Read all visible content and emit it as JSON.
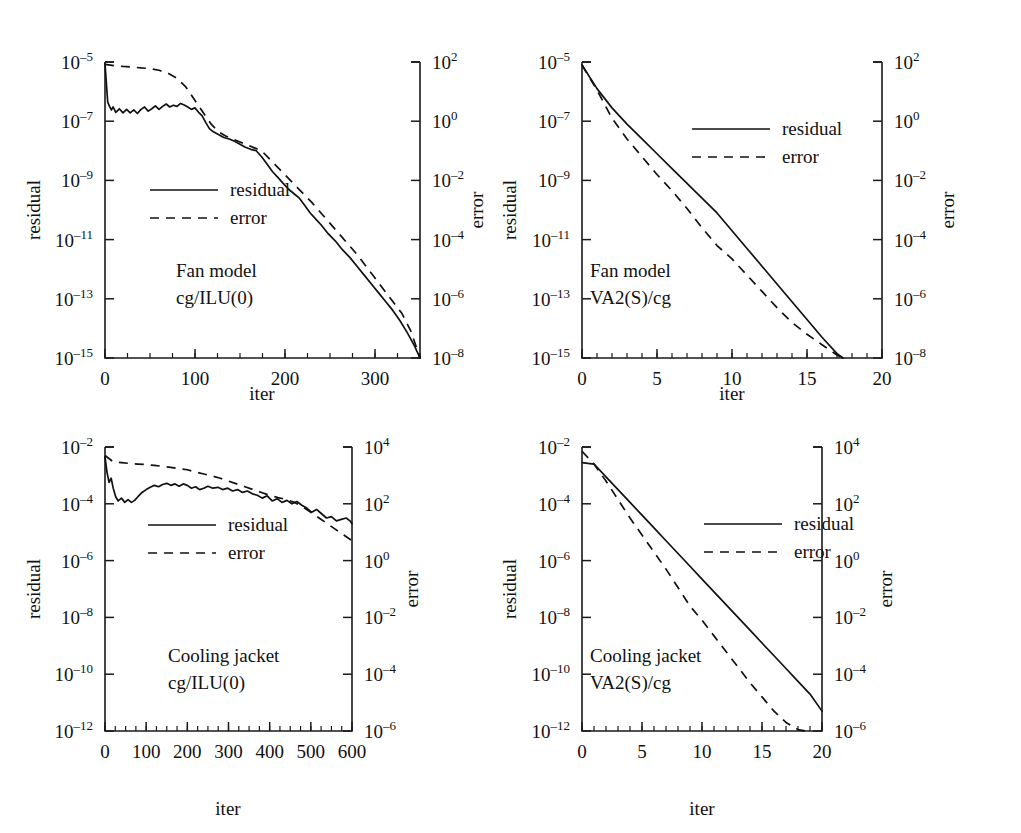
{
  "figure": {
    "kind": "four-panel-convergence-figure",
    "legend_labels": {
      "residual": "residual",
      "error": "error"
    },
    "axis_names": {
      "x": "iter",
      "left_y": "residual",
      "right_y": "error"
    }
  },
  "chart_data": [
    {
      "id": "top-left",
      "type": "line",
      "title": "",
      "annotation_line1": "Fan model",
      "annotation_line2": "cg/ILU(0)",
      "xlabel": "iter",
      "ylabel": "residual",
      "y2label": "error",
      "xlim": [
        0,
        350
      ],
      "xticks": [
        0,
        100,
        200,
        300
      ],
      "xticklabels": [
        "0",
        "100",
        "200",
        "300"
      ],
      "xminor_step": 25,
      "ylim_exp": [
        -15,
        -5
      ],
      "yticks_exp": [
        -15,
        -13,
        -11,
        -9,
        -7,
        -5
      ],
      "yticklabels": [
        "10^-15",
        "10^-13",
        "10^-11",
        "10^-9",
        "10^-7",
        "10^-5"
      ],
      "y2lim_exp": [
        -8,
        2
      ],
      "y2ticks_exp": [
        -8,
        -6,
        -4,
        -2,
        0,
        2
      ],
      "y2ticklabels": [
        "10^-8",
        "10^-6",
        "10^-4",
        "10^-2",
        "10^0",
        "10^2"
      ],
      "grid": false,
      "legend_position": "center-left",
      "series": [
        {
          "name": "residual",
          "style": "solid",
          "x": [
            0,
            3,
            5,
            7,
            9,
            12,
            16,
            20,
            24,
            28,
            32,
            36,
            40,
            44,
            48,
            52,
            56,
            60,
            64,
            68,
            72,
            76,
            80,
            84,
            88,
            92,
            96,
            100,
            104,
            108,
            112,
            116,
            120,
            126,
            132,
            138,
            144,
            150,
            156,
            162,
            168,
            174,
            180,
            186,
            192,
            198,
            204,
            210,
            216,
            222,
            228,
            234,
            240,
            248,
            256,
            264,
            272,
            280,
            288,
            296,
            304,
            312,
            320,
            328,
            336,
            344,
            350
          ],
          "y_exp": [
            -5.05,
            -6.35,
            -6.5,
            -6.62,
            -6.52,
            -6.7,
            -6.58,
            -6.72,
            -6.6,
            -6.72,
            -6.62,
            -6.74,
            -6.6,
            -6.52,
            -6.66,
            -6.58,
            -6.48,
            -6.6,
            -6.5,
            -6.42,
            -6.52,
            -6.46,
            -6.5,
            -6.4,
            -6.45,
            -6.52,
            -6.6,
            -6.55,
            -6.7,
            -6.82,
            -7.05,
            -7.25,
            -7.35,
            -7.45,
            -7.55,
            -7.6,
            -7.68,
            -7.78,
            -7.88,
            -7.95,
            -8.0,
            -8.2,
            -8.45,
            -8.7,
            -8.9,
            -9.1,
            -9.3,
            -9.45,
            -9.6,
            -9.85,
            -10.1,
            -10.3,
            -10.5,
            -10.8,
            -11.05,
            -11.35,
            -11.6,
            -11.9,
            -12.2,
            -12.5,
            -12.8,
            -13.1,
            -13.4,
            -13.75,
            -14.15,
            -14.6,
            -15.0
          ]
        },
        {
          "name": "error",
          "style": "dashed",
          "x": [
            0,
            10,
            20,
            30,
            40,
            50,
            60,
            70,
            80,
            90,
            100,
            110,
            118,
            126,
            134,
            142,
            150,
            158,
            166,
            174,
            182,
            190,
            198,
            206,
            214,
            222,
            230,
            240,
            250,
            260,
            270,
            280,
            290,
            300,
            310,
            320,
            330,
            340,
            350
          ],
          "y_exp": [
            -5.08,
            -5.12,
            -5.15,
            -5.17,
            -5.2,
            -5.22,
            -5.28,
            -5.38,
            -5.55,
            -5.85,
            -6.3,
            -6.75,
            -7.1,
            -7.35,
            -7.5,
            -7.6,
            -7.7,
            -7.8,
            -7.9,
            -8.0,
            -8.25,
            -8.5,
            -8.75,
            -9.0,
            -9.25,
            -9.5,
            -9.75,
            -10.1,
            -10.45,
            -10.8,
            -11.15,
            -11.5,
            -11.9,
            -12.3,
            -12.7,
            -13.1,
            -13.5,
            -14.1,
            -15.0
          ]
        }
      ]
    },
    {
      "id": "top-right",
      "type": "line",
      "title": "",
      "annotation_line1": "Fan model",
      "annotation_line2": "VA2(S)/cg",
      "xlabel": "iter",
      "ylabel": "residual",
      "y2label": "error",
      "xlim": [
        0,
        20
      ],
      "xticks": [
        0,
        5,
        10,
        15,
        20
      ],
      "xticklabels": [
        "0",
        "5",
        "10",
        "15",
        "20"
      ],
      "xminor_step": 1,
      "ylim_exp": [
        -15,
        -5
      ],
      "yticks_exp": [
        -15,
        -13,
        -11,
        -9,
        -7,
        -5
      ],
      "yticklabels": [
        "10^-15",
        "10^-13",
        "10^-11",
        "10^-9",
        "10^-7",
        "10^-5"
      ],
      "y2lim_exp": [
        -8,
        2
      ],
      "y2ticks_exp": [
        -8,
        -6,
        -4,
        -2,
        0,
        2
      ],
      "y2ticklabels": [
        "10^-8",
        "10^-6",
        "10^-4",
        "10^-2",
        "10^0",
        "10^2"
      ],
      "grid": false,
      "legend_position": "upper-right",
      "series": [
        {
          "name": "residual",
          "style": "solid",
          "x": [
            0,
            1,
            2,
            3,
            4,
            5,
            6,
            7,
            8,
            9,
            10,
            11,
            12,
            13,
            14,
            15,
            16,
            17,
            17.4
          ],
          "y_exp": [
            -5.1,
            -5.9,
            -6.55,
            -7.1,
            -7.6,
            -8.1,
            -8.6,
            -9.1,
            -9.6,
            -10.1,
            -10.7,
            -11.3,
            -11.9,
            -12.5,
            -13.1,
            -13.7,
            -14.3,
            -14.85,
            -15.0
          ]
        },
        {
          "name": "error",
          "style": "dashed",
          "x": [
            0,
            1,
            2,
            3,
            4,
            5,
            6,
            7,
            8,
            9,
            10,
            11,
            12,
            13,
            14,
            15,
            16,
            17,
            17.4
          ],
          "y_exp": [
            -5.1,
            -5.95,
            -6.9,
            -7.6,
            -8.2,
            -8.8,
            -9.35,
            -9.95,
            -10.6,
            -11.2,
            -11.65,
            -12.2,
            -12.75,
            -13.3,
            -13.8,
            -14.2,
            -14.55,
            -14.9,
            -15.0
          ]
        }
      ]
    },
    {
      "id": "bottom-left",
      "type": "line",
      "title": "",
      "annotation_line1": "Cooling jacket",
      "annotation_line2": "cg/ILU(0)",
      "xlabel": "iter",
      "ylabel": "residual",
      "y2label": "error",
      "xlim": [
        0,
        600
      ],
      "xticks": [
        0,
        100,
        200,
        300,
        400,
        500,
        600
      ],
      "xticklabels": [
        "0",
        "100",
        "200",
        "300",
        "400",
        "500",
        "600"
      ],
      "xminor_step": 25,
      "ylim_exp": [
        -12,
        -2
      ],
      "yticks_exp": [
        -12,
        -10,
        -8,
        -6,
        -4,
        -2
      ],
      "yticklabels": [
        "10^-12",
        "10^-10",
        "10^-8",
        "10^-6",
        "10^-4",
        "10^-2"
      ],
      "y2lim_exp": [
        -6,
        4
      ],
      "y2ticks_exp": [
        -6,
        -4,
        -2,
        0,
        2,
        4
      ],
      "y2ticklabels": [
        "10^-6",
        "10^-4",
        "10^-2",
        "10^0",
        "10^2",
        "10^4"
      ],
      "grid": false,
      "legend_position": "center-left",
      "series": [
        {
          "name": "residual",
          "style": "solid",
          "x": [
            0,
            5,
            10,
            15,
            20,
            26,
            32,
            40,
            48,
            56,
            64,
            72,
            80,
            90,
            100,
            110,
            120,
            130,
            140,
            150,
            160,
            170,
            180,
            190,
            200,
            210,
            220,
            230,
            240,
            250,
            262,
            274,
            286,
            298,
            310,
            322,
            334,
            346,
            358,
            370,
            382,
            394,
            406,
            418,
            430,
            442,
            454,
            466,
            478,
            490,
            502,
            514,
            526,
            538,
            550,
            562,
            574,
            586,
            595,
            600
          ],
          "y_exp": [
            -2.35,
            -2.9,
            -3.25,
            -3.1,
            -3.45,
            -3.75,
            -3.9,
            -3.8,
            -3.95,
            -3.85,
            -3.95,
            -3.88,
            -3.75,
            -3.6,
            -3.5,
            -3.42,
            -3.35,
            -3.4,
            -3.32,
            -3.28,
            -3.35,
            -3.3,
            -3.38,
            -3.3,
            -3.35,
            -3.45,
            -3.4,
            -3.5,
            -3.45,
            -3.38,
            -3.45,
            -3.42,
            -3.5,
            -3.45,
            -3.55,
            -3.5,
            -3.6,
            -3.55,
            -3.65,
            -3.7,
            -3.8,
            -3.72,
            -3.9,
            -3.82,
            -3.95,
            -3.88,
            -4.0,
            -3.92,
            -4.05,
            -4.15,
            -4.3,
            -4.2,
            -4.35,
            -4.5,
            -4.45,
            -4.6,
            -4.55,
            -4.5,
            -4.6,
            -4.7
          ]
        },
        {
          "name": "error",
          "style": "dashed",
          "x": [
            0,
            20,
            40,
            60,
            80,
            100,
            120,
            140,
            160,
            180,
            200,
            220,
            240,
            260,
            280,
            300,
            320,
            340,
            360,
            380,
            400,
            420,
            440,
            460,
            480,
            500,
            520,
            540,
            560,
            580,
            600
          ],
          "y_exp": [
            -2.3,
            -2.52,
            -2.55,
            -2.58,
            -2.6,
            -2.62,
            -2.65,
            -2.68,
            -2.72,
            -2.76,
            -2.8,
            -2.88,
            -2.95,
            -3.02,
            -3.1,
            -3.2,
            -3.3,
            -3.4,
            -3.5,
            -3.6,
            -3.7,
            -3.78,
            -3.85,
            -3.95,
            -4.1,
            -4.3,
            -4.5,
            -4.7,
            -4.9,
            -5.1,
            -5.3
          ]
        }
      ]
    },
    {
      "id": "bottom-right",
      "type": "line",
      "title": "",
      "annotation_line1": "Cooling jacket",
      "annotation_line2": "VA2(S)/cg",
      "xlabel": "iter",
      "ylabel": "residual",
      "y2label": "error",
      "xlim": [
        0,
        20
      ],
      "xticks": [
        0,
        5,
        10,
        15,
        20
      ],
      "xticklabels": [
        "0",
        "5",
        "10",
        "15",
        "20"
      ],
      "xminor_step": 1,
      "ylim_exp": [
        -12,
        -2
      ],
      "yticks_exp": [
        -12,
        -10,
        -8,
        -6,
        -4,
        -2
      ],
      "yticklabels": [
        "10^-12",
        "10^-10",
        "10^-8",
        "10^-6",
        "10^-4",
        "10^-2"
      ],
      "y2lim_exp": [
        -6,
        4
      ],
      "y2ticks_exp": [
        -6,
        -4,
        -2,
        0,
        2,
        4
      ],
      "y2ticklabels": [
        "10^-6",
        "10^-4",
        "10^-2",
        "10^0",
        "10^2",
        "10^4"
      ],
      "grid": false,
      "legend_position": "upper-right",
      "series": [
        {
          "name": "residual",
          "style": "solid",
          "x": [
            0,
            1,
            2,
            3,
            4,
            5,
            6,
            7,
            8,
            9,
            10,
            11,
            12,
            13,
            14,
            15,
            16,
            17,
            18,
            19,
            20
          ],
          "y_exp": [
            -2.55,
            -2.6,
            -3.05,
            -3.5,
            -3.95,
            -4.4,
            -4.85,
            -5.3,
            -5.75,
            -6.2,
            -6.65,
            -7.1,
            -7.55,
            -8.0,
            -8.45,
            -8.9,
            -9.35,
            -9.8,
            -10.25,
            -10.7,
            -11.3
          ]
        },
        {
          "name": "error",
          "style": "dashed",
          "x": [
            0,
            1,
            2,
            3,
            4,
            5,
            6,
            7,
            8,
            9,
            10,
            11,
            12,
            13,
            14,
            15,
            16,
            17,
            18,
            18.6
          ],
          "y_exp": [
            -2.15,
            -2.6,
            -3.2,
            -3.85,
            -4.5,
            -5.1,
            -5.7,
            -6.3,
            -6.95,
            -7.6,
            -8.1,
            -8.65,
            -9.2,
            -9.75,
            -10.3,
            -10.8,
            -11.3,
            -11.7,
            -11.95,
            -12.0
          ]
        }
      ]
    }
  ]
}
